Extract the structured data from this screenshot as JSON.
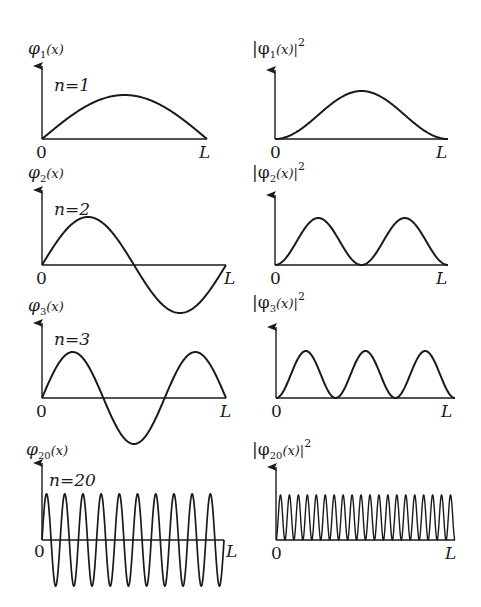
{
  "colors": {
    "ink": "#1a1a1a",
    "background": "#ffffff"
  },
  "panels": [
    {
      "n": 1,
      "n_label": "n=1",
      "psi_label_main": "φ",
      "psi_label_sub": "1",
      "psi_label_arg": "(x)",
      "prob_label_main": "|φ",
      "prob_label_sub": "1",
      "prob_label_arg": "(x)|",
      "prob_label_sup": "2",
      "origin_label": "0",
      "end_label": "L"
    },
    {
      "n": 2,
      "n_label": "n=2",
      "psi_label_main": "φ",
      "psi_label_sub": "2",
      "psi_label_arg": "(x)",
      "prob_label_main": "|φ",
      "prob_label_sub": "2",
      "prob_label_arg": "(x)|",
      "prob_label_sup": "2",
      "origin_label": "0",
      "end_label": "L"
    },
    {
      "n": 3,
      "n_label": "n=3",
      "psi_label_main": "φ",
      "psi_label_sub": "3",
      "psi_label_arg": "(x)",
      "prob_label_main": "|φ",
      "prob_label_sub": "3",
      "prob_label_arg": "(x)|",
      "prob_label_sup": "2",
      "origin_label": "0",
      "end_label": "L"
    },
    {
      "n": 20,
      "n_label": "n=20",
      "psi_label_main": "φ",
      "psi_label_sub": "20",
      "psi_label_arg": "(x)",
      "prob_label_main": "|φ",
      "prob_label_sub": "20",
      "prob_label_arg": "(x)|",
      "prob_label_sup": "2",
      "origin_label": "0",
      "end_label": "L"
    }
  ],
  "chart_data": [
    {
      "type": "line",
      "title": "φ1(x)",
      "function": "sin(1πx/L)",
      "n": 1,
      "x_range": [
        0,
        1
      ],
      "xlabel_ticks": [
        "0",
        "L"
      ]
    },
    {
      "type": "line",
      "title": "|φ1(x)|²",
      "function": "sin²(1πx/L)",
      "n": 1,
      "x_range": [
        0,
        1
      ],
      "xlabel_ticks": [
        "0",
        "L"
      ]
    },
    {
      "type": "line",
      "title": "φ2(x)",
      "function": "sin(2πx/L)",
      "n": 2,
      "x_range": [
        0,
        1
      ],
      "xlabel_ticks": [
        "0",
        "L"
      ]
    },
    {
      "type": "line",
      "title": "|φ2(x)|²",
      "function": "sin²(2πx/L)",
      "n": 2,
      "x_range": [
        0,
        1
      ],
      "xlabel_ticks": [
        "0",
        "L"
      ]
    },
    {
      "type": "line",
      "title": "φ3(x)",
      "function": "sin(3πx/L)",
      "n": 3,
      "x_range": [
        0,
        1
      ],
      "xlabel_ticks": [
        "0",
        "L"
      ]
    },
    {
      "type": "line",
      "title": "|φ3(x)|²",
      "function": "sin²(3πx/L)",
      "n": 3,
      "x_range": [
        0,
        1
      ],
      "xlabel_ticks": [
        "0",
        "L"
      ]
    },
    {
      "type": "line",
      "title": "φ20(x)",
      "function": "sin(20πx/L)",
      "n": 20,
      "x_range": [
        0,
        1
      ],
      "xlabel_ticks": [
        "0",
        "L"
      ]
    },
    {
      "type": "line",
      "title": "|φ20(x)|²",
      "function": "sin²(20πx/L)",
      "n": 20,
      "x_range": [
        0,
        1
      ],
      "xlabel_ticks": [
        "0",
        "L"
      ]
    }
  ]
}
